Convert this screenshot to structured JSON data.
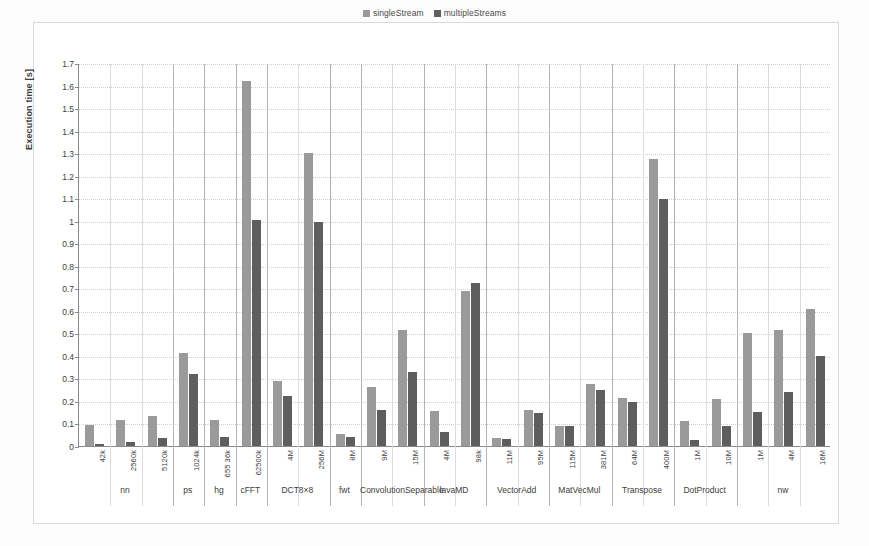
{
  "chart_data": {
    "type": "bar",
    "title": "",
    "xlabel": "",
    "ylabel": "Execution time [s]",
    "ylim": [
      0,
      1.7
    ],
    "ytick_step": 0.1,
    "grid": true,
    "legend_position": "top-center",
    "categories": [
      "42k",
      "2560k",
      "5120k",
      "1024k",
      "655 36k",
      "62500k",
      "4M",
      "256M",
      "8M",
      "9M",
      "15M",
      "4M",
      "98k",
      "11M",
      "95M",
      "115M",
      "381M",
      "64M",
      "400M",
      "1M",
      "10M",
      "1M",
      "4M",
      "16M"
    ],
    "groups": [
      {
        "label": "nn",
        "count": 3
      },
      {
        "label": "ps",
        "count": 1
      },
      {
        "label": "hg",
        "count": 1
      },
      {
        "label": "cFFT",
        "count": 1
      },
      {
        "label": "DCT8×8",
        "count": 2
      },
      {
        "label": "fwt",
        "count": 1
      },
      {
        "label": "ConvolutionSeparable",
        "count": 2
      },
      {
        "label": "lavaMD",
        "count": 2
      },
      {
        "label": "VectorAdd",
        "count": 2
      },
      {
        "label": "MatVecMul",
        "count": 2
      },
      {
        "label": "Transpose",
        "count": 2
      },
      {
        "label": "DotProduct",
        "count": 2
      },
      {
        "label": "nw",
        "count": 3
      }
    ],
    "series": [
      {
        "name": "singleStream",
        "color": "#9a9a9a",
        "values": [
          0.095,
          0.115,
          0.135,
          0.415,
          0.115,
          1.62,
          0.29,
          1.3,
          0.055,
          0.26,
          0.515,
          0.155,
          0.69,
          0.035,
          0.16,
          0.09,
          0.275,
          0.215,
          1.275,
          0.11,
          0.21,
          0.5,
          0.515,
          0.61
        ]
      },
      {
        "name": "multipleStreams",
        "color": "#5e5e5e",
        "values": [
          0.01,
          0.02,
          0.035,
          0.32,
          0.04,
          1.005,
          0.22,
          0.995,
          0.04,
          0.16,
          0.33,
          0.06,
          0.725,
          0.03,
          0.145,
          0.09,
          0.25,
          0.195,
          1.095,
          0.025,
          0.09,
          0.15,
          0.24,
          0.4
        ]
      }
    ],
    "ytick_labels": [
      "0",
      "0.1",
      "0.2",
      "0.3",
      "0.4",
      "0.5",
      "0.6",
      "0.7",
      "0.8",
      "0.9",
      "1",
      "1.1",
      "1.2",
      "1.3",
      "1.4",
      "1.5",
      "1.6",
      "1.7"
    ]
  },
  "legend": {
    "entries": [
      {
        "label": "singleStream",
        "color": "#9a9a9a"
      },
      {
        "label": "multipleStreams",
        "color": "#5e5e5e"
      }
    ]
  },
  "axis": {
    "y_title": "Execution time [s]"
  }
}
